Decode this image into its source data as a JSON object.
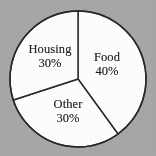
{
  "chart_data": {
    "type": "pie",
    "title": "",
    "subtitle": "",
    "xlabel": "",
    "ylabel": "",
    "legend_position": "none",
    "grid": false,
    "start_angle_deg": 0,
    "direction": "clockwise",
    "categories": [
      "Food",
      "Other",
      "Housing"
    ],
    "values": [
      40,
      30,
      30
    ],
    "units": "%",
    "slices": [
      {
        "name": "Food",
        "value": 40,
        "value_label": "40%",
        "start_angle_deg": 0,
        "end_angle_deg": 144,
        "fill": "#ffffff",
        "stroke": "#2b2726"
      },
      {
        "name": "Other",
        "value": 30,
        "value_label": "30%",
        "start_angle_deg": 144,
        "end_angle_deg": 252,
        "fill": "#ffffff",
        "stroke": "#2b2726"
      },
      {
        "name": "Housing",
        "value": 30,
        "value_label": "30%",
        "start_angle_deg": 252,
        "end_angle_deg": 360,
        "fill": "#ffffff",
        "stroke": "#2b2726"
      }
    ],
    "colors": {
      "background": "#a8a8a8",
      "slice_fill": "#ffffff",
      "outline": "#2b2726",
      "text": "#231f1e"
    },
    "geometry": {
      "center_x": 78,
      "center_y": 79,
      "radius": 68
    }
  }
}
